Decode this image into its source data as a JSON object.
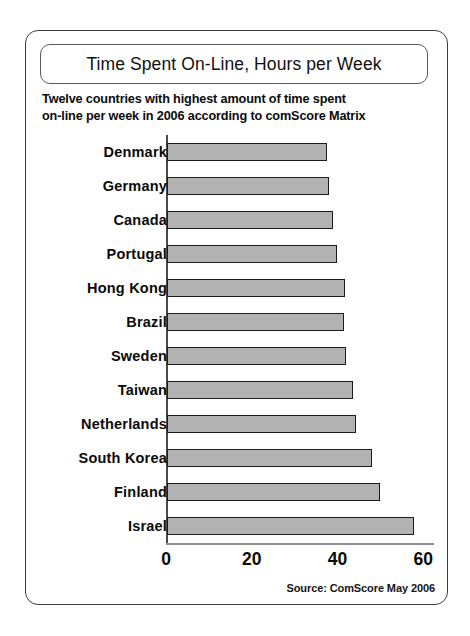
{
  "chart_data": {
    "type": "bar",
    "orientation": "horizontal",
    "title": "Time Spent On-Line, Hours per Week",
    "subtitle_line1": "Twelve countries with highest amount of time spent",
    "subtitle_line2": "on-line per week in 2006 according to comScore Matrix",
    "source": "Source: ComScore May 2006",
    "xlabel": "",
    "ylabel": "",
    "xlim": [
      0,
      62.5
    ],
    "grid": false,
    "legend": false,
    "xticks": [
      0,
      20,
      40,
      60
    ],
    "xtick_labels": [
      "0",
      "20",
      "40",
      "60"
    ],
    "categories": [
      "Denmark",
      "Germany",
      "Canada",
      "Portugal",
      "Hong Kong",
      "Brazil",
      "Sweden",
      "Taiwan",
      "Netherlands",
      "South Korea",
      "Finland",
      "Israel"
    ],
    "values": [
      37.2,
      37.7,
      38.6,
      39.6,
      41.4,
      41.2,
      41.7,
      43.3,
      44.0,
      47.7,
      49.6,
      57.5
    ],
    "colors": {
      "bar_fill": "#b2b2b2",
      "bar_edge": "#1c1c1c",
      "frame": "#3d3d3d",
      "text": "#0a0a0a",
      "axis": "#8f8f8f",
      "background": "#ffffff"
    }
  }
}
